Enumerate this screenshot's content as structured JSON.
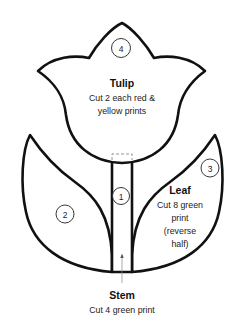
{
  "diagram": {
    "pieces": [
      {
        "number": "1",
        "name": "stem"
      },
      {
        "number": "2",
        "name": "left-leaf"
      },
      {
        "number": "3",
        "name": "right-leaf"
      },
      {
        "number": "4",
        "name": "tulip"
      }
    ],
    "tulip": {
      "title": "Tulip",
      "line1": "Cut 2 each red &",
      "line2": "yellow prints"
    },
    "leaf": {
      "title": "Leaf",
      "line1": "Cut 8 green",
      "line2": "print",
      "line3": "(reverse",
      "line4": "half)"
    },
    "stem": {
      "title": "Stem",
      "line1": "Cut 4 green print"
    }
  }
}
